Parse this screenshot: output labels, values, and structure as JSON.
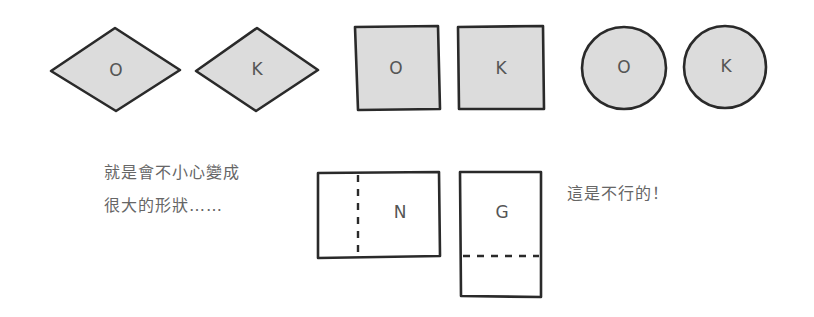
{
  "good_examples": {
    "diamonds": [
      {
        "label": "O"
      },
      {
        "label": "K"
      }
    ],
    "squares": [
      {
        "label": "O"
      },
      {
        "label": "K"
      }
    ],
    "circles": [
      {
        "label": "O"
      },
      {
        "label": "K"
      }
    ]
  },
  "bad_examples": {
    "caption_left": {
      "line1": "就是會不小心變成",
      "line2": "很大的形狀……"
    },
    "rectangles": [
      {
        "label": "N",
        "fold": "vertical-dashed"
      },
      {
        "label": "G",
        "fold": "horizontal-dashed"
      }
    ],
    "caption_right": "這是不行的！"
  },
  "colors": {
    "fill": "#dcdcdc",
    "stroke": "#2a2a2a",
    "text": "#666666"
  }
}
